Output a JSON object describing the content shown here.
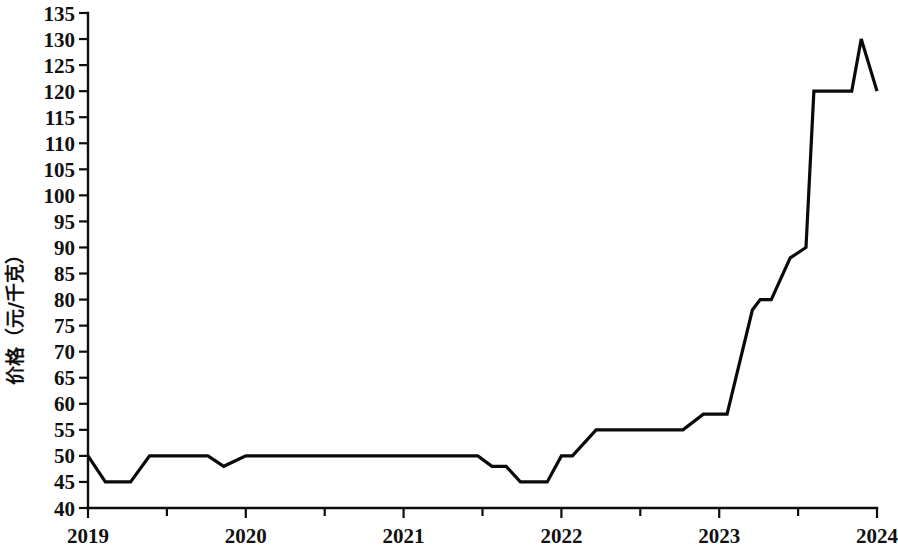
{
  "chart_data": {
    "type": "line",
    "title": "",
    "subtitle": "",
    "xlabel": "",
    "ylabel": "价格（元/千克）",
    "xlim": [
      2019,
      2024
    ],
    "ylim": [
      40,
      135
    ],
    "grid": false,
    "legend": null,
    "x_ticks": [
      "2019",
      "2020",
      "2021",
      "2022",
      "2023",
      "2024"
    ],
    "x_tick_values": [
      2019,
      2020,
      2021,
      2022,
      2023,
      2024
    ],
    "x_minor_ticks": [
      2019.5,
      2020.5,
      2021.5,
      2022.5,
      2023.5
    ],
    "y_ticks": [
      "40",
      "45",
      "50",
      "55",
      "60",
      "65",
      "70",
      "75",
      "80",
      "85",
      "90",
      "95",
      "100",
      "105",
      "110",
      "115",
      "120",
      "125",
      "130",
      "135"
    ],
    "y_tick_values": [
      40,
      45,
      50,
      55,
      60,
      65,
      70,
      75,
      80,
      85,
      90,
      95,
      100,
      105,
      110,
      115,
      120,
      125,
      130,
      135
    ],
    "series": [
      {
        "name": "价格",
        "color": "#0a0a0a",
        "x": [
          2019.0,
          2019.11,
          2019.27,
          2019.39,
          2019.76,
          2019.86,
          2020.0,
          2021.47,
          2021.56,
          2021.65,
          2021.74,
          2021.91,
          2022.0,
          2022.07,
          2022.22,
          2022.77,
          2022.9,
          2023.05,
          2023.21,
          2023.26,
          2023.33,
          2023.45,
          2023.55,
          2023.6,
          2023.84,
          2023.9,
          2024.0
        ],
        "values": [
          50,
          45,
          45,
          50,
          50,
          48,
          50,
          50,
          48,
          48,
          45,
          45,
          50,
          50,
          55,
          55,
          58,
          58,
          78,
          80,
          80,
          88,
          90,
          120,
          120,
          130,
          120
        ]
      }
    ]
  },
  "axes": {
    "y_axis_label": "价格（元/千克）"
  }
}
